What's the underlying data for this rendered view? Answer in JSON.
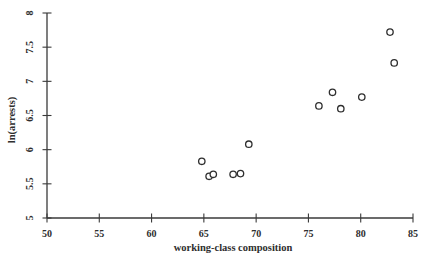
{
  "figure": {
    "background": "#ffffff",
    "ink_color": "#2e2e2e",
    "axis_color": "#3a3a3a"
  },
  "chart_data": {
    "type": "scatter",
    "title": "",
    "xlabel": "working-class composition",
    "ylabel": "ln(arrests)",
    "xlim": [
      50,
      85
    ],
    "ylim": [
      5,
      8
    ],
    "x_ticks": [
      50,
      55,
      60,
      65,
      70,
      75,
      80,
      85
    ],
    "y_ticks": [
      5,
      5.5,
      6,
      6.5,
      7,
      7.5,
      8
    ],
    "grid": false,
    "legend": null,
    "marker": {
      "shape": "open-circle",
      "radius": 3.2,
      "stroke": "#2e2e2e",
      "fill": "#ffffff"
    },
    "points": [
      {
        "x": 64.8,
        "y": 5.83
      },
      {
        "x": 65.5,
        "y": 5.61
      },
      {
        "x": 65.9,
        "y": 5.64
      },
      {
        "x": 67.8,
        "y": 5.64
      },
      {
        "x": 68.5,
        "y": 5.65
      },
      {
        "x": 69.3,
        "y": 6.08
      },
      {
        "x": 76.0,
        "y": 6.64
      },
      {
        "x": 77.3,
        "y": 6.84
      },
      {
        "x": 78.1,
        "y": 6.6
      },
      {
        "x": 80.1,
        "y": 6.77
      },
      {
        "x": 82.8,
        "y": 7.72
      },
      {
        "x": 83.2,
        "y": 7.27
      }
    ]
  }
}
